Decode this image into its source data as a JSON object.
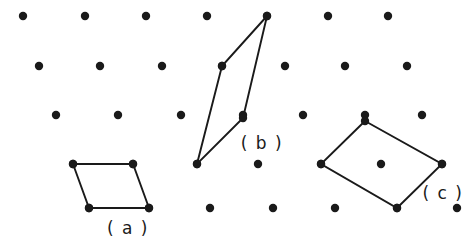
{
  "figure": {
    "type": "2d-lattice-unit-cells-diagram",
    "background_color": "#ffffff",
    "ink_color": "#1a1a1a",
    "width": 475,
    "height": 251,
    "dot_radius": 4.2,
    "line_width": 1.9
  },
  "lattice": {
    "description": "oblique 2D point lattice, rows shifted right going down",
    "row_spacing": 48,
    "column_spacing": 60.5,
    "row_shift": 16,
    "rows": [
      {
        "y": 16,
        "points_x": [
          23,
          85,
          146,
          207,
          267,
          328,
          388
        ]
      },
      {
        "y": 66,
        "points_x": [
          39,
          100,
          162,
          222,
          285,
          345,
          407
        ]
      },
      {
        "y": 115,
        "points_x": [
          56,
          118,
          181,
          243,
          303,
          365,
          422
        ]
      },
      {
        "y": 164,
        "points_x": [
          73,
          133,
          197,
          258,
          321,
          381,
          442
        ]
      },
      {
        "y": 208,
        "points_x": [
          89,
          149,
          210,
          273,
          335,
          397,
          457
        ]
      }
    ]
  },
  "cells": [
    {
      "id": "cell-a",
      "label": "( a )",
      "label_x": 128,
      "label_y": 228,
      "vertices": [
        {
          "x": 73,
          "y": 164
        },
        {
          "x": 133,
          "y": 164
        },
        {
          "x": 149,
          "y": 208
        },
        {
          "x": 89,
          "y": 208
        }
      ]
    },
    {
      "id": "cell-b",
      "label": "( b )",
      "label_x": 262,
      "label_y": 143,
      "vertices": [
        {
          "x": 267,
          "y": 16
        },
        {
          "x": 243,
          "y": 118
        },
        {
          "x": 197,
          "y": 164
        },
        {
          "x": 222,
          "y": 66
        }
      ]
    },
    {
      "id": "cell-c",
      "label": "( c )",
      "label_x": 443,
      "label_y": 193,
      "vertices": [
        {
          "x": 365,
          "y": 121
        },
        {
          "x": 442,
          "y": 164
        },
        {
          "x": 397,
          "y": 208
        },
        {
          "x": 321,
          "y": 164
        }
      ]
    }
  ],
  "chart_data": {
    "type": "scatter",
    "title": "",
    "xlabel": "",
    "ylabel": "",
    "xlim": [
      0,
      475
    ],
    "ylim": [
      0,
      251
    ],
    "grid": false,
    "legend": "none",
    "series": [
      {
        "name": "lattice-points",
        "marker": "filled-circle",
        "color": "#1a1a1a",
        "x": [
          23,
          85,
          146,
          207,
          267,
          328,
          388,
          39,
          100,
          162,
          222,
          285,
          345,
          407,
          56,
          118,
          181,
          243,
          303,
          365,
          422,
          73,
          133,
          197,
          258,
          321,
          381,
          442,
          89,
          149,
          210,
          273,
          335,
          397,
          457
        ],
        "y": [
          16,
          16,
          16,
          16,
          16,
          16,
          16,
          66,
          66,
          66,
          66,
          66,
          66,
          66,
          115,
          115,
          115,
          115,
          115,
          115,
          115,
          164,
          164,
          164,
          164,
          164,
          164,
          164,
          208,
          208,
          208,
          208,
          208,
          208,
          208
        ]
      }
    ],
    "annotations": [
      {
        "text": "( a )",
        "x": 128,
        "y": 228
      },
      {
        "text": "( b )",
        "x": 262,
        "y": 143
      },
      {
        "text": "( c )",
        "x": 443,
        "y": 193
      }
    ]
  }
}
